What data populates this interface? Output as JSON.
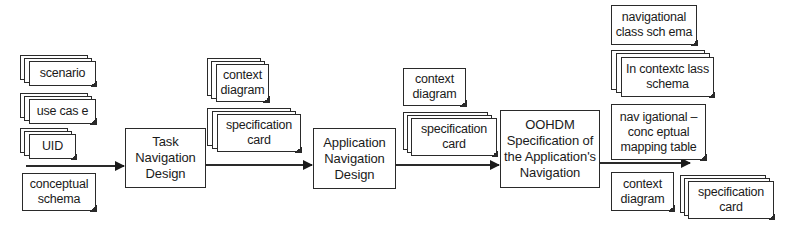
{
  "diagram": {
    "type": "process-flow",
    "inputs": [
      {
        "label": "scenario",
        "stacked": true
      },
      {
        "label": "use cas e",
        "stacked": true
      },
      {
        "label": "UID",
        "stacked": true
      },
      {
        "label": "conceptual\nschema",
        "stacked": false
      }
    ],
    "processes": [
      {
        "id": "task",
        "label": "Task\nNavigation\nDesign"
      },
      {
        "id": "app",
        "label": "Application\nNavigation\nDesign"
      },
      {
        "id": "oohdm",
        "label": "OOHDM\nSpecification of\nthe Application's\nNavigation"
      }
    ],
    "artifacts_after_task": [
      {
        "label": "context\ndiagram",
        "stacked": true
      },
      {
        "label": "specification\ncard",
        "stacked": true
      }
    ],
    "artifacts_after_app": [
      {
        "label": "context\ndiagram",
        "stacked": false
      },
      {
        "label": "specification\ncard",
        "stacked": true
      }
    ],
    "outputs": [
      {
        "label": "navigational\nclass sch ema",
        "stacked": false
      },
      {
        "label": "In contextc lass\nschema",
        "stacked": true
      },
      {
        "label": "nav igational –\nconc eptual\nmapping table",
        "stacked": false
      },
      {
        "label": "context\ndiagram",
        "stacked": false
      },
      {
        "label": "specification\ncard",
        "stacked": true
      }
    ],
    "edges": [
      {
        "from": "inputs",
        "to": "task"
      },
      {
        "from": "task",
        "to": "app"
      },
      {
        "from": "app",
        "to": "oohdm"
      },
      {
        "from": "oohdm",
        "to": "outputs"
      }
    ],
    "colors": {
      "line": "#2a2a2a",
      "background": "#ffffff"
    }
  }
}
